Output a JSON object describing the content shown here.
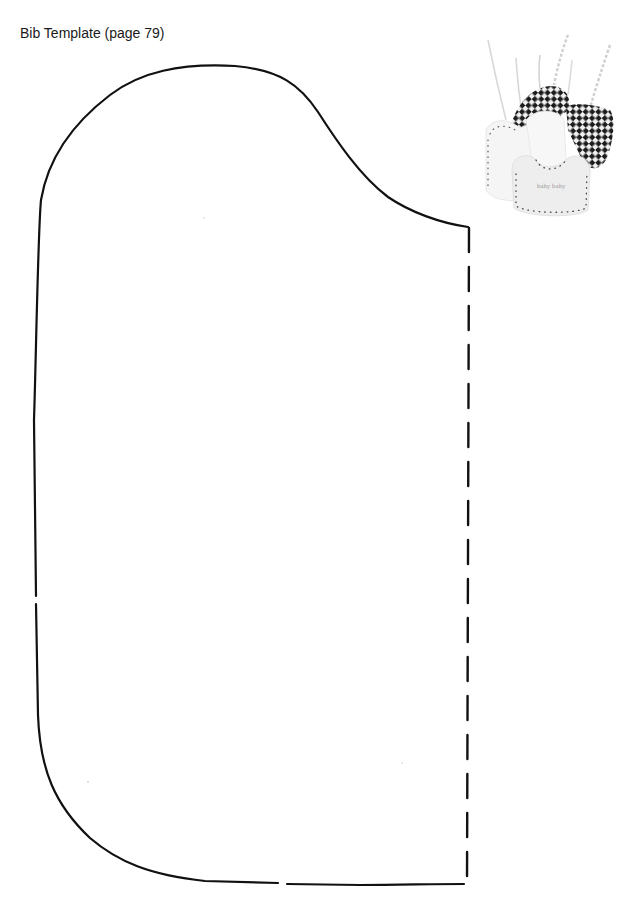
{
  "page": {
    "title": "Bib Template (page 79)"
  },
  "template": {
    "shape": "bib-half-pattern",
    "outline": "solid cut line",
    "fold_line": "dashed fold line (right edge)",
    "stroke_color": "#111111"
  },
  "photo": {
    "subject": "three finished bibs with ties (white, black-and-white checkered, white with embroidered text)",
    "embroidered_text": "baby baby",
    "colors": {
      "checker_dark": "#1c1c1c",
      "bib_white": "#f4f4f4",
      "stitch_dots": "#555555"
    }
  }
}
